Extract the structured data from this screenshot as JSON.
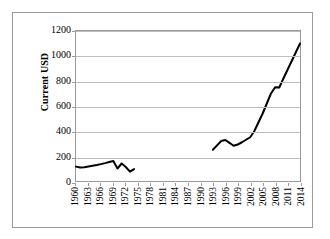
{
  "chart_data": {
    "type": "line",
    "title": "",
    "xlabel": "",
    "ylabel": "Current USD",
    "ylim": [
      0,
      1200
    ],
    "ytick_labels": [
      "0",
      "200",
      "400",
      "600",
      "800",
      "1000",
      "1200"
    ],
    "ytick_values": [
      0,
      200,
      400,
      600,
      800,
      1000,
      1200
    ],
    "grid": true,
    "legend": "none",
    "xlim": [
      1960,
      2014
    ],
    "xtick_labels": [
      "1960",
      "1963",
      "1966",
      "1969",
      "1972",
      "1975",
      "1978",
      "1981",
      "1984",
      "1987",
      "1990",
      "1993",
      "1996",
      "1999",
      "2002",
      "2005",
      "2008",
      "2011",
      "2014"
    ],
    "xtick_values": [
      1960,
      1963,
      1966,
      1969,
      1972,
      1975,
      1978,
      1981,
      1984,
      1987,
      1990,
      1993,
      1996,
      1999,
      2002,
      2005,
      2008,
      2011,
      2014
    ],
    "line_color": "#000000",
    "line_width": 2,
    "series": [
      {
        "name": "Current USD",
        "x": [
          1960,
          1961,
          1962,
          1963,
          1964,
          1965,
          1966,
          1967,
          1968,
          1969,
          1970,
          1971,
          1972,
          1973,
          1974
        ],
        "values": [
          115,
          108,
          110,
          116,
          122,
          128,
          135,
          143,
          152,
          160,
          100,
          140,
          112,
          75,
          95
        ]
      },
      {
        "name": "Current USD",
        "x": [
          1993,
          1994,
          1995,
          1996,
          1997,
          1998,
          1999,
          2000,
          2001,
          2002,
          2003,
          2004,
          2005,
          2006,
          2007,
          2008,
          2009,
          2010,
          2011,
          2012,
          2013,
          2014
        ],
        "values": [
          250,
          285,
          320,
          328,
          305,
          282,
          292,
          310,
          330,
          350,
          400,
          470,
          540,
          620,
          700,
          750,
          748,
          820,
          890,
          960,
          1030,
          1100
        ]
      }
    ],
    "gap_note": "No data plotted between 1975 and 1992"
  }
}
